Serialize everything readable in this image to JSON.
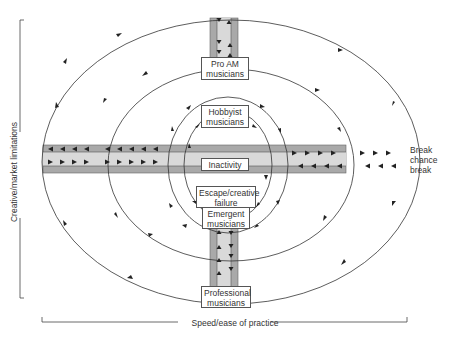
{
  "diagram": {
    "nodes": {
      "pro_am": "Pro AM musicians",
      "pro_am_l1": "Pro AM",
      "pro_am_l2": "musicians",
      "hobbyist_l1": "Hobbyist",
      "hobbyist_l2": "musicians",
      "inactivity": "Inactivity",
      "escape_l1": "Escape/creative",
      "escape_l2": "failure",
      "emergent_l1": "Emergent",
      "emergent_l2": "musicians",
      "professional_l1": "Professional",
      "professional_l2": "musicians"
    },
    "side_label": {
      "l1": "Break",
      "l2": "chance",
      "l3": "break"
    },
    "axes": {
      "x_label": "Speed/ease of practice",
      "y_label": "Creative/market limitations"
    },
    "colors": {
      "band_dark": "#a9a9a9",
      "band_light": "#d9d9d9",
      "line": "#333333",
      "box_border": "#555555"
    }
  }
}
